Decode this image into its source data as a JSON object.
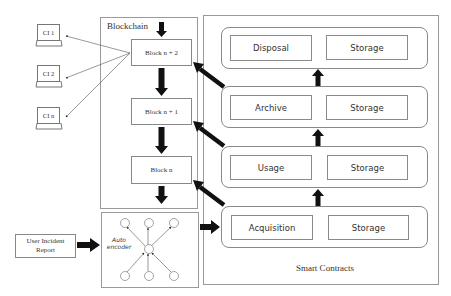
{
  "blockchain": {
    "title": "Blockchain",
    "blocks": [
      {
        "label": "Block n + 2"
      },
      {
        "label": "Block n + 1"
      },
      {
        "label": "Block n"
      }
    ]
  },
  "clients": [
    {
      "label": "CI 1"
    },
    {
      "label": "CI 2"
    },
    {
      "label": "CI n"
    }
  ],
  "input": {
    "label_line1": "User Incident",
    "label_line2": "Report"
  },
  "autoencoder": {
    "label_line1": "Auto",
    "label_line2": "encoder"
  },
  "smart_contracts": {
    "title": "Smart Contracts",
    "stages": [
      {
        "name": "Disposal",
        "storage": "Storage"
      },
      {
        "name": "Archive",
        "storage": "Storage"
      },
      {
        "name": "Usage",
        "storage": "Storage"
      },
      {
        "name": "Acquisition",
        "storage": "Storage"
      }
    ]
  }
}
